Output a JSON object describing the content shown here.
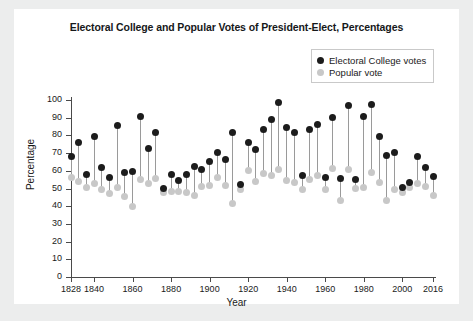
{
  "figure": {
    "title": "Electoral College and Popular Votes of President-Elect, Percentages",
    "background": "#ffffff",
    "page_background": "#eceded"
  },
  "legend": {
    "position": "top-right",
    "items": [
      {
        "label": "Electoral College votes",
        "color": "#1c1c1c",
        "marker": "filled-circle"
      },
      {
        "label": "Popular vote",
        "color": "#c8c8c8",
        "marker": "filled-circle"
      }
    ]
  },
  "axes": {
    "y": {
      "label": "Percentage",
      "ticks": [
        0,
        10,
        20,
        30,
        40,
        50,
        60,
        70,
        80,
        90,
        100
      ],
      "min": 0,
      "max": 100
    },
    "x": {
      "label": "Year",
      "ticks": [
        1828,
        1840,
        1860,
        1880,
        1900,
        1920,
        1940,
        1960,
        1980,
        2000,
        2016
      ],
      "min": 1828,
      "max": 2016
    }
  },
  "chart_data": {
    "type": "scatter",
    "title": "Electoral College and Popular Votes of President-Elect, Percentages",
    "xlabel": "Year",
    "ylabel": "Percentage",
    "xlim": [
      1828,
      2016
    ],
    "ylim": [
      0,
      100
    ],
    "grid": false,
    "legend_position": "upper right",
    "x": [
      1828,
      1832,
      1836,
      1840,
      1844,
      1848,
      1852,
      1856,
      1860,
      1864,
      1868,
      1872,
      1876,
      1880,
      1884,
      1888,
      1892,
      1896,
      1900,
      1904,
      1908,
      1912,
      1916,
      1920,
      1924,
      1928,
      1932,
      1936,
      1940,
      1944,
      1948,
      1952,
      1956,
      1960,
      1964,
      1968,
      1972,
      1976,
      1980,
      1984,
      1988,
      1992,
      1996,
      2000,
      2004,
      2008,
      2012,
      2016
    ],
    "series": [
      {
        "name": "Electoral College votes",
        "color": "#1c1c1c",
        "values": [
          68.2,
          76.0,
          57.8,
          79.6,
          61.8,
          56.2,
          85.8,
          58.8,
          59.4,
          90.6,
          72.8,
          81.9,
          50.1,
          58.0,
          54.6,
          58.1,
          62.4,
          60.6,
          65.3,
          70.6,
          66.5,
          81.9,
          52.2,
          76.1,
          71.9,
          83.6,
          88.9,
          98.5,
          84.6,
          81.4,
          57.1,
          83.2,
          86.1,
          56.4,
          90.3,
          55.9,
          96.7,
          55.2,
          90.9,
          97.6,
          79.2,
          68.8,
          70.4,
          50.4,
          53.2,
          67.8,
          61.7,
          56.9
        ]
      },
      {
        "name": "Popular vote",
        "color": "#c8c8c8",
        "values": [
          56.0,
          54.2,
          50.8,
          52.9,
          49.5,
          47.3,
          50.8,
          45.3,
          39.8,
          55.0,
          52.7,
          55.6,
          47.9,
          48.3,
          48.5,
          47.8,
          46.0,
          51.0,
          51.6,
          56.4,
          51.6,
          41.8,
          49.2,
          60.3,
          54.0,
          58.2,
          57.4,
          60.8,
          54.7,
          53.4,
          49.6,
          55.2,
          57.4,
          49.7,
          61.1,
          43.4,
          60.7,
          50.1,
          50.7,
          58.8,
          53.4,
          43.0,
          49.2,
          47.9,
          50.7,
          52.9,
          51.1,
          46.1
        ]
      }
    ]
  }
}
